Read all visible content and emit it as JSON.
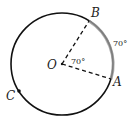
{
  "diagram": {
    "type": "circle-geometry",
    "circle": {
      "cx": 62,
      "cy": 64,
      "r": 51,
      "stroke": "#111111"
    },
    "points": {
      "O": {
        "label": "O",
        "x": 62,
        "y": 64
      },
      "A": {
        "label": "A",
        "x": 111,
        "y": 79
      },
      "B": {
        "label": "B",
        "x": 89,
        "y": 21
      },
      "C": {
        "label": "C",
        "x": 19,
        "y": 91
      }
    },
    "segments": [
      {
        "from": "O",
        "to": "A",
        "style": "dashed"
      },
      {
        "from": "O",
        "to": "B",
        "style": "dashed"
      }
    ],
    "highlighted_arc": {
      "from": "B",
      "to": "A",
      "color": "#999999"
    },
    "angle_labels": {
      "central": "70°",
      "arc": "70°"
    }
  }
}
